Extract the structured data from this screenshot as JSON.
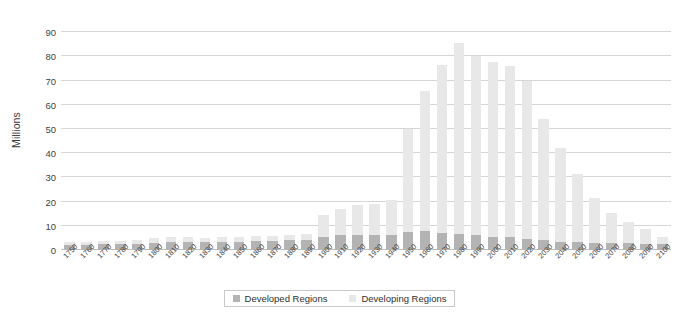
{
  "chart_data": {
    "type": "bar",
    "stacked": true,
    "title": "",
    "subtitle": "",
    "xlabel": "",
    "ylabel": "Millions",
    "ylim": [
      0,
      95
    ],
    "yticks": [
      0,
      10,
      20,
      30,
      40,
      50,
      60,
      70,
      80,
      90
    ],
    "grid": true,
    "legend_position": "bottom",
    "categories": [
      "1750",
      "1760",
      "1770",
      "1780",
      "1790",
      "1800",
      "1810",
      "1820",
      "1830",
      "1840",
      "1850",
      "1860",
      "1870",
      "1880",
      "1890",
      "1900",
      "1910",
      "1920",
      "1930",
      "1940",
      "1950",
      "1960",
      "1970",
      "1980",
      "1990",
      "2000",
      "2010",
      "2020",
      "2030",
      "2040",
      "2050",
      "2060",
      "2070",
      "2080",
      "2090",
      "2100"
    ],
    "series": [
      {
        "name": "Developed Regions",
        "color": "#b3b3b3",
        "values": [
          2.2,
          2.2,
          2.3,
          2.4,
          2.5,
          3.0,
          3.2,
          3.3,
          3.2,
          3.2,
          3.5,
          3.7,
          3.8,
          4.0,
          4.2,
          5.5,
          6.0,
          6.2,
          6.2,
          6.0,
          7.5,
          8.0,
          7.0,
          6.5,
          6.0,
          5.5,
          5.5,
          4.5,
          4.0,
          3.5,
          3.2,
          3.0,
          2.8,
          2.7,
          2.6,
          2.5
        ]
      },
      {
        "name": "Developing Regions",
        "color": "#e8e8e8",
        "values": [
          1.3,
          1.3,
          1.4,
          1.5,
          1.6,
          2.0,
          2.0,
          1.9,
          1.8,
          2.0,
          2.0,
          2.1,
          2.2,
          2.4,
          2.6,
          9.0,
          11.0,
          12.5,
          12.7,
          14.5,
          42.5,
          57.5,
          69.5,
          79.0,
          74.0,
          72.0,
          70.5,
          65.5,
          50.0,
          38.5,
          28.0,
          18.5,
          12.5,
          9.0,
          6.0,
          3.0
        ]
      }
    ],
    "totals": [
      3.5,
      3.5,
      3.7,
      3.9,
      4.1,
      5.0,
      5.2,
      5.2,
      5.0,
      5.2,
      5.5,
      5.8,
      6.0,
      6.4,
      6.8,
      14.5,
      17.0,
      18.7,
      18.9,
      20.5,
      50.0,
      65.5,
      76.5,
      85.5,
      80.0,
      77.5,
      76.0,
      70.0,
      54.0,
      42.0,
      31.2,
      21.5,
      15.3,
      11.7,
      8.6,
      5.5
    ]
  },
  "legend": {
    "items": [
      {
        "label": "Developed Regions",
        "color": "#b3b3b3"
      },
      {
        "label": "Developing Regions",
        "color": "#e8e8e8"
      }
    ]
  }
}
